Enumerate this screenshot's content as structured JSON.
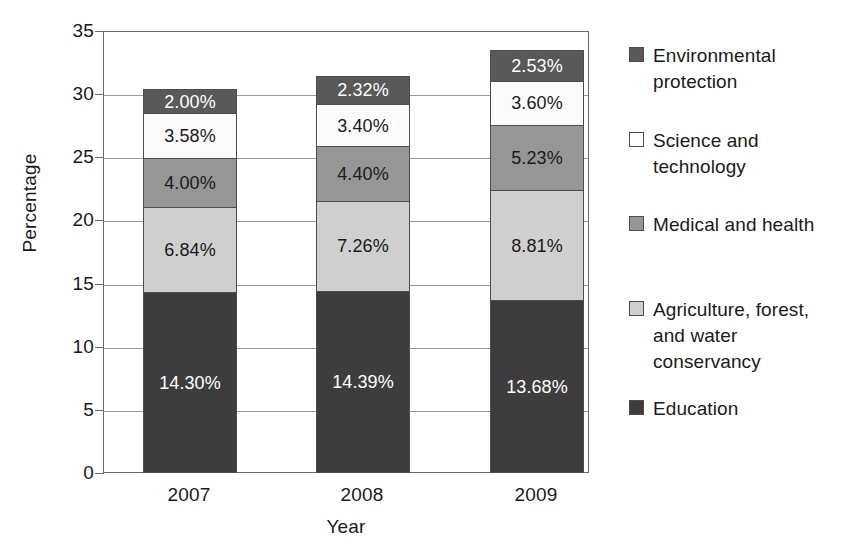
{
  "chart_data": {
    "type": "bar",
    "subtype": "stacked-bar",
    "title": "",
    "xlabel": "Year",
    "ylabel": "Percentage",
    "categories": [
      "2007",
      "2008",
      "2009"
    ],
    "ylim": [
      0,
      35
    ],
    "yticks": [
      0,
      5,
      10,
      15,
      20,
      25,
      30,
      35
    ],
    "ytick_labels": [
      "0",
      "5",
      "10",
      "15",
      "20",
      "25",
      "30",
      "35"
    ],
    "grid": true,
    "legend_position": "right",
    "value_suffix": "%",
    "stack_order_bottom_to_top": [
      "Education",
      "Agriculture, forest, and water conservancy",
      "Medical and health",
      "Science and technology",
      "Environmental protection"
    ],
    "series": [
      {
        "name": "Education",
        "color": "#3d3d3d",
        "label_color": "#ffffff",
        "values": [
          14.3,
          14.39,
          13.68
        ],
        "labels": [
          "14.30%",
          "14.39%",
          "13.68%"
        ]
      },
      {
        "name": "Agriculture, forest, and water conservancy",
        "color": "#cfcfcf",
        "label_color": "#1a1a1a",
        "values": [
          6.84,
          7.26,
          8.81
        ],
        "labels": [
          "6.84%",
          "7.26%",
          "8.81%"
        ]
      },
      {
        "name": "Medical and health",
        "color": "#969696",
        "label_color": "#1a1a1a",
        "values": [
          4.0,
          4.4,
          5.23
        ],
        "labels": [
          "4.00%",
          "4.40%",
          "5.23%"
        ]
      },
      {
        "name": "Science and technology",
        "color": "#fbfbfb",
        "label_color": "#1a1a1a",
        "values": [
          3.58,
          3.4,
          3.6
        ],
        "labels": [
          "3.58%",
          "3.40%",
          "3.60%"
        ]
      },
      {
        "name": "Environmental protection",
        "color": "#595959",
        "label_color": "#ffffff",
        "values": [
          2.0,
          2.32,
          2.53
        ],
        "labels": [
          "2.00%",
          "2.32%",
          "2.53%"
        ]
      }
    ],
    "totals": [
      30.72,
      31.77,
      33.85
    ]
  },
  "legend": {
    "entries": [
      {
        "label": "Environmental protection",
        "color": "#595959"
      },
      {
        "label": "Science and technology",
        "color": "#ffffff"
      },
      {
        "label": "Medical and health",
        "color": "#969696"
      },
      {
        "label": "Agriculture, forest, and water conservancy",
        "color": "#cfcfcf"
      },
      {
        "label": "Education",
        "color": "#3d3d3d"
      }
    ]
  }
}
